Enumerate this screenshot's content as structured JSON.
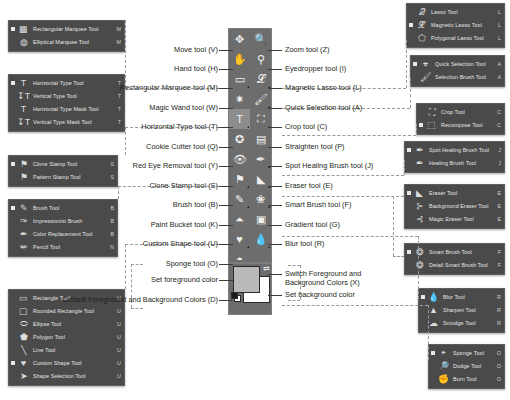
{
  "toolbar": {
    "name": "tools-palette",
    "columns": 2,
    "cells": [
      {
        "id": "move",
        "icon": "move-icon",
        "glyph": "✥",
        "has_flyout": false,
        "active": false
      },
      {
        "id": "zoom",
        "icon": "zoom-icon",
        "glyph": "🔍",
        "has_flyout": false,
        "active": false
      },
      {
        "id": "hand",
        "icon": "hand-icon",
        "glyph": "✋",
        "has_flyout": false,
        "active": false
      },
      {
        "id": "eyedropper",
        "icon": "eyedropper-icon",
        "glyph": "⚲",
        "has_flyout": false,
        "active": false
      },
      {
        "id": "rect-marquee",
        "icon": "rectangular-marquee-icon",
        "glyph": "▭",
        "has_flyout": true,
        "active": false
      },
      {
        "id": "magnetic-lasso",
        "icon": "magnetic-lasso-icon",
        "glyph": "𝓛",
        "has_flyout": true,
        "active": false
      },
      {
        "id": "magic-wand",
        "icon": "magic-wand-icon",
        "glyph": "✷",
        "has_flyout": false,
        "active": false
      },
      {
        "id": "quick-selection",
        "icon": "quick-selection-icon",
        "glyph": "🖌",
        "has_flyout": true,
        "active": false
      },
      {
        "id": "horizontal-type",
        "icon": "horizontal-type-icon",
        "glyph": "T",
        "has_flyout": true,
        "active": true
      },
      {
        "id": "crop",
        "icon": "crop-icon",
        "glyph": "⛶",
        "has_flyout": true,
        "active": false
      },
      {
        "id": "cookie-cutter",
        "icon": "cookie-cutter-icon",
        "glyph": "✪",
        "has_flyout": false,
        "active": false
      },
      {
        "id": "straighten",
        "icon": "straighten-icon",
        "glyph": "▤",
        "has_flyout": false,
        "active": false
      },
      {
        "id": "red-eye-removal",
        "icon": "red-eye-removal-icon",
        "glyph": "👁",
        "has_flyout": false,
        "active": false
      },
      {
        "id": "spot-healing-brush",
        "icon": "spot-healing-brush-icon",
        "glyph": "✒",
        "has_flyout": true,
        "active": false
      },
      {
        "id": "clone-stamp",
        "icon": "clone-stamp-icon",
        "glyph": "⚑",
        "has_flyout": true,
        "active": false
      },
      {
        "id": "eraser",
        "icon": "eraser-icon",
        "glyph": "◣",
        "has_flyout": true,
        "active": false
      },
      {
        "id": "brush",
        "icon": "brush-icon",
        "glyph": "✎",
        "has_flyout": true,
        "active": false
      },
      {
        "id": "smart-brush",
        "icon": "smart-brush-icon",
        "glyph": "❀",
        "has_flyout": true,
        "active": false
      },
      {
        "id": "paint-bucket",
        "icon": "paint-bucket-icon",
        "glyph": "⏶",
        "has_flyout": false,
        "active": false
      },
      {
        "id": "gradient",
        "icon": "gradient-icon",
        "glyph": "▣",
        "has_flyout": false,
        "active": false
      },
      {
        "id": "custom-shape",
        "icon": "custom-shape-icon",
        "glyph": "♥",
        "has_flyout": true,
        "active": false
      },
      {
        "id": "blur",
        "icon": "blur-icon",
        "glyph": "💧",
        "has_flyout": true,
        "active": false
      },
      {
        "id": "sponge",
        "icon": "sponge-icon",
        "glyph": "◓",
        "has_flyout": true,
        "active": false
      }
    ],
    "color_controls": {
      "foreground_swatch_color": "#b9b9b9",
      "background_swatch_color": "#ffffff",
      "switch_icon": "switch-colors-icon",
      "default_icon": "default-colors-icon"
    }
  },
  "left_labels": [
    {
      "id": "move",
      "text": "Move tool (V)"
    },
    {
      "id": "hand",
      "text": "Hand tool (H)"
    },
    {
      "id": "rect-marquee",
      "text": "Rectangular Marquee tool (M)"
    },
    {
      "id": "magic-wand",
      "text": "Magic Wand tool (W)"
    },
    {
      "id": "horizontal-type",
      "text": "Horizontal Type tool (T)"
    },
    {
      "id": "cookie-cutter",
      "text": "Cookie Cutter tool (Q)"
    },
    {
      "id": "red-eye",
      "text": "Red Eye Removal tool (Y)"
    },
    {
      "id": "clone-stamp",
      "text": "Clone Stamp tool (S)"
    },
    {
      "id": "brush",
      "text": "Brush tool (B)"
    },
    {
      "id": "paint-bucket",
      "text": "Paint Bucket tool (K)"
    },
    {
      "id": "custom-shape",
      "text": "Custom Shape tool (U)"
    },
    {
      "id": "sponge",
      "text": "Sponge tool (O)"
    },
    {
      "id": "set-foreground",
      "text": "Set foreground color"
    },
    {
      "id": "default-colors",
      "text": "Default Foreground and\nBackground Colors (D)"
    }
  ],
  "right_labels": [
    {
      "id": "zoom",
      "text": "Zoom tool (Z)"
    },
    {
      "id": "eyedropper",
      "text": "Eyedropper tool (I)"
    },
    {
      "id": "magnetic-lasso",
      "text": "Magnetic Lasso tool (L)"
    },
    {
      "id": "quick-selection",
      "text": "Quick Selection tool (A)"
    },
    {
      "id": "crop",
      "text": "Crop tool (C)"
    },
    {
      "id": "straighten",
      "text": "Straighten tool (P)"
    },
    {
      "id": "spot-healing",
      "text": "Spot Healing Brush tool (J)"
    },
    {
      "id": "eraser",
      "text": "Eraser tool (E)"
    },
    {
      "id": "smart-brush",
      "text": "Smart Brush tool (F)"
    },
    {
      "id": "gradient",
      "text": "Gradient tool (G)"
    },
    {
      "id": "blur",
      "text": "Blur tool (R)"
    },
    {
      "id": "switch-colors",
      "text": "Switch Foreground and\nBackground Colors (X)"
    },
    {
      "id": "set-background",
      "text": "Set background color"
    }
  ],
  "flyouts": {
    "marquee": {
      "name": "marquee-flyout",
      "items": [
        {
          "label": "Rectangular Marquee Tool",
          "key": "M",
          "icon": "rectangular-marquee-icon",
          "glyph": "▩",
          "selected": true
        },
        {
          "label": "Elliptical Marquee Tool",
          "key": "M",
          "icon": "elliptical-marquee-icon",
          "glyph": "◍",
          "selected": false
        }
      ]
    },
    "type": {
      "name": "type-flyout",
      "items": [
        {
          "label": "Horizontal Type Tool",
          "key": "T",
          "icon": "horizontal-type-icon",
          "glyph": "T",
          "selected": true
        },
        {
          "label": "Vertical Type Tool",
          "key": "T",
          "icon": "vertical-type-icon",
          "glyph": "↧T",
          "selected": false
        },
        {
          "label": "Horizontal Type Mask Tool",
          "key": "T",
          "icon": "horizontal-type-mask-icon",
          "glyph": "T",
          "selected": false
        },
        {
          "label": "Vertical Type Mask Tool",
          "key": "T",
          "icon": "vertical-type-mask-icon",
          "glyph": "↧T",
          "selected": false
        }
      ]
    },
    "clone": {
      "name": "clone-stamp-flyout",
      "items": [
        {
          "label": "Clone Stamp Tool",
          "key": "S",
          "icon": "clone-stamp-icon",
          "glyph": "⚑",
          "selected": true
        },
        {
          "label": "Pattern Stamp Tool",
          "key": "S",
          "icon": "pattern-stamp-icon",
          "glyph": "⚑",
          "selected": false
        }
      ]
    },
    "brush": {
      "name": "brush-flyout",
      "items": [
        {
          "label": "Brush Tool",
          "key": "B",
          "icon": "brush-icon",
          "glyph": "✎",
          "selected": true
        },
        {
          "label": "Impressionist Brush",
          "key": "B",
          "icon": "impressionist-brush-icon",
          "glyph": "✑",
          "selected": false
        },
        {
          "label": "Color Replacement Tool",
          "key": "B",
          "icon": "color-replacement-icon",
          "glyph": "✒",
          "selected": false
        },
        {
          "label": "Pencil Tool",
          "key": "N",
          "icon": "pencil-icon",
          "glyph": "✏",
          "selected": false
        }
      ]
    },
    "shape": {
      "name": "shape-flyout",
      "items": [
        {
          "label": "Rectangle Tool",
          "key": "U",
          "icon": "rectangle-icon",
          "glyph": "▭",
          "selected": false
        },
        {
          "label": "Rounded Rectangle Tool",
          "key": "U",
          "icon": "rounded-rectangle-icon",
          "glyph": "▢",
          "selected": false
        },
        {
          "label": "Ellipse Tool",
          "key": "U",
          "icon": "ellipse-icon",
          "glyph": "⬭",
          "selected": false
        },
        {
          "label": "Polygon Tool",
          "key": "U",
          "icon": "polygon-icon",
          "glyph": "⬟",
          "selected": false
        },
        {
          "label": "Line Tool",
          "key": "U",
          "icon": "line-icon",
          "glyph": "╲",
          "selected": false
        },
        {
          "label": "Custom Shape Tool",
          "key": "U",
          "icon": "custom-shape-icon",
          "glyph": "♥",
          "selected": true
        },
        {
          "label": "Shape Selection Tool",
          "key": "U",
          "icon": "shape-selection-icon",
          "glyph": "➤",
          "selected": false
        }
      ]
    },
    "lasso": {
      "name": "lasso-flyout",
      "items": [
        {
          "label": "Lasso Tool",
          "key": "L",
          "icon": "lasso-icon",
          "glyph": "𝒬",
          "selected": false
        },
        {
          "label": "Magnetic Lasso Tool",
          "key": "L",
          "icon": "magnetic-lasso-icon",
          "glyph": "𝓛",
          "selected": true
        },
        {
          "label": "Polygonal Lasso Tool",
          "key": "L",
          "icon": "polygonal-lasso-icon",
          "glyph": "⬠",
          "selected": false
        }
      ]
    },
    "selection": {
      "name": "quick-selection-flyout",
      "items": [
        {
          "label": "Quick Selection Tool",
          "key": "A",
          "icon": "quick-selection-icon",
          "glyph": "⌖",
          "selected": true
        },
        {
          "label": "Selection Brush Tool",
          "key": "A",
          "icon": "selection-brush-icon",
          "glyph": "🖌",
          "selected": false
        }
      ]
    },
    "crop": {
      "name": "crop-flyout",
      "items": [
        {
          "label": "Crop Tool",
          "key": "C",
          "icon": "crop-icon",
          "glyph": "⛶",
          "selected": false
        },
        {
          "label": "Recompose Tool",
          "key": "C",
          "icon": "recompose-icon",
          "glyph": "⬚",
          "selected": true
        }
      ]
    },
    "healing": {
      "name": "healing-flyout",
      "items": [
        {
          "label": "Spot Healing Brush Tool",
          "key": "J",
          "icon": "spot-healing-brush-icon",
          "glyph": "✒",
          "selected": true
        },
        {
          "label": "Healing Brush Tool",
          "key": "J",
          "icon": "healing-brush-icon",
          "glyph": "✒",
          "selected": false
        }
      ]
    },
    "eraser": {
      "name": "eraser-flyout",
      "items": [
        {
          "label": "Eraser Tool",
          "key": "E",
          "icon": "eraser-icon",
          "glyph": "◣",
          "selected": true
        },
        {
          "label": "Background Eraser Tool",
          "key": "E",
          "icon": "background-eraser-icon",
          "glyph": "⊱",
          "selected": false
        },
        {
          "label": "Magic Eraser Tool",
          "key": "E",
          "icon": "magic-eraser-icon",
          "glyph": "⊰",
          "selected": false
        }
      ]
    },
    "smart": {
      "name": "smart-brush-flyout",
      "items": [
        {
          "label": "Smart Brush Tool",
          "key": "F",
          "icon": "smart-brush-icon",
          "glyph": "❂",
          "selected": true
        },
        {
          "label": "Detail Smart Brush Tool",
          "key": "F",
          "icon": "detail-smart-brush-icon",
          "glyph": "❂",
          "selected": false
        }
      ]
    },
    "blur": {
      "name": "blur-flyout",
      "items": [
        {
          "label": "Blur Tool",
          "key": "R",
          "icon": "blur-icon",
          "glyph": "💧",
          "selected": true
        },
        {
          "label": "Sharpen Tool",
          "key": "R",
          "icon": "sharpen-icon",
          "glyph": "▲",
          "selected": false
        },
        {
          "label": "Smudge Tool",
          "key": "R",
          "icon": "smudge-icon",
          "glyph": "☁",
          "selected": false
        }
      ]
    },
    "sponge": {
      "name": "sponge-flyout",
      "items": [
        {
          "label": "Sponge Tool",
          "key": "O",
          "icon": "sponge-icon",
          "glyph": "◓",
          "selected": true
        },
        {
          "label": "Dodge Tool",
          "key": "O",
          "icon": "dodge-icon",
          "glyph": "🔎",
          "selected": false
        },
        {
          "label": "Burn Tool",
          "key": "O",
          "icon": "burn-icon",
          "glyph": "✊",
          "selected": false
        }
      ]
    }
  }
}
